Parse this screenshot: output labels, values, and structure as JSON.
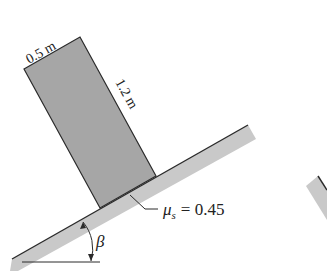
{
  "diagram": {
    "type": "block-on-incline",
    "block": {
      "width_label": "0.5 m",
      "height_label": "1.2 m",
      "fill": "#a6a6a6"
    },
    "incline": {
      "fill": "#c9c9c9",
      "angle_label": "β"
    },
    "friction": {
      "symbol": "μ",
      "subscript": "s",
      "equals": "= 0.45"
    },
    "colors": {
      "outline": "#2a2a2a",
      "block": "#a6a6a6",
      "incline": "#c9c9c9"
    }
  }
}
